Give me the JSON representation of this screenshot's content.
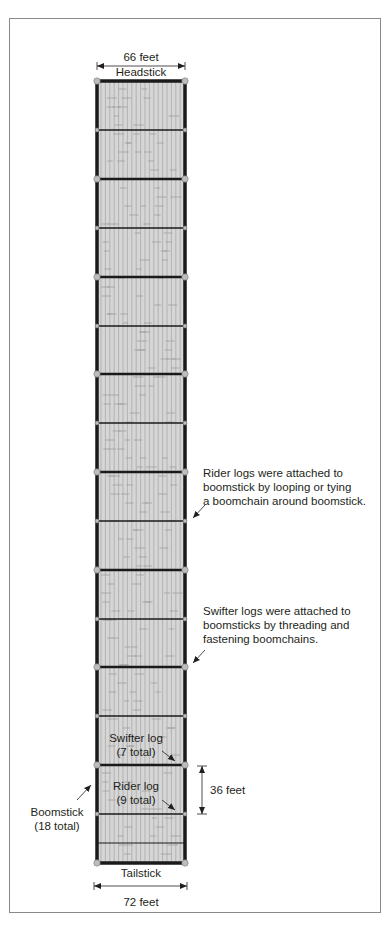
{
  "figure": {
    "top_dimension": "66 feet",
    "headstick_label": "Headstick",
    "tailstick_label": "Tailstick",
    "bottom_dimension": "72 feet",
    "side_dimension": "36 feet",
    "rider_note": [
      "Rider logs were attached to",
      "boomstick by looping or tying",
      "a boomchain around boomstick."
    ],
    "swifter_note": [
      "Swifter logs were attached to",
      "boomsticks by threading and",
      "fastening boomchains."
    ],
    "swifter_label": [
      "Swifter log",
      "(7 total)"
    ],
    "rider_label": [
      "Rider log",
      "(9 total)"
    ],
    "boomstick_label": [
      "Boomstick",
      "(18 total)"
    ]
  },
  "geometry": {
    "raft_left": 97,
    "raft_right": 185,
    "head_y": 81,
    "tail_y": 863,
    "cross_lines": [
      {
        "y": 130,
        "type": "swifter"
      },
      {
        "y": 179,
        "type": "rider"
      },
      {
        "y": 228,
        "type": "swifter"
      },
      {
        "y": 277,
        "type": "rider"
      },
      {
        "y": 326,
        "type": "swifter"
      },
      {
        "y": 374,
        "type": "rider"
      },
      {
        "y": 423,
        "type": "swifter"
      },
      {
        "y": 472,
        "type": "rider"
      },
      {
        "y": 521,
        "type": "swifter"
      },
      {
        "y": 570,
        "type": "rider"
      },
      {
        "y": 619,
        "type": "swifter"
      },
      {
        "y": 667,
        "type": "rider"
      },
      {
        "y": 716,
        "type": "swifter"
      },
      {
        "y": 765,
        "type": "rider"
      },
      {
        "y": 814,
        "type": "swifter"
      },
      {
        "y": 843,
        "type": "plain"
      }
    ]
  },
  "colors": {
    "log_fill": "#d6d6d6",
    "log_line": "#9a9a9a",
    "boom": "#1a1a1a",
    "node": "#bdbdbd",
    "frame": "#8a8a8a"
  }
}
